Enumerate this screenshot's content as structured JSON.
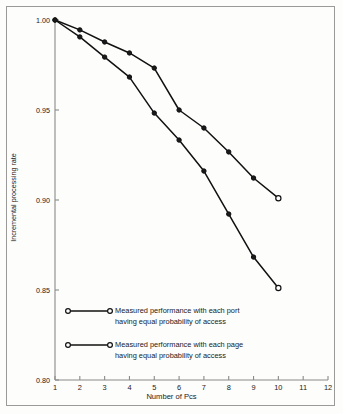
{
  "chart_data": {
    "type": "line",
    "title": "",
    "xlabel": "Number of Pcs",
    "ylabel": "Incremental processing rate",
    "xlim": [
      1,
      12
    ],
    "ylim": [
      0.8,
      1.0
    ],
    "xticks": [
      "1",
      "2",
      "3",
      "4",
      "5",
      "6",
      "7",
      "8",
      "9",
      "10",
      "11",
      "12"
    ],
    "yticks": [
      "1.00",
      "0.95",
      "0.90",
      "0.85",
      "0.80"
    ],
    "grid": false,
    "legend_position": "inside-lower-left",
    "x": [
      1,
      2,
      3,
      4,
      5,
      6,
      7,
      8,
      9,
      10
    ],
    "series": [
      {
        "name": "Measured performance with each port having equal probability of access",
        "label_line1": "Measured performance with each port",
        "label_line2": "having equal probability of access",
        "marker": "circle",
        "color": "#111111",
        "values": [
          1.0,
          0.9945,
          0.9895,
          0.9835,
          0.9795,
          0.9722,
          0.9655,
          0.9595,
          0.9512,
          0.901
        ]
      },
      {
        "name": "Measured performance with each page having equal probability of access",
        "label_line1": "Measured performance with each page",
        "label_line2": "having equal probability of access",
        "marker": "circle",
        "color": "#111111",
        "values": [
          1.0,
          0.992,
          0.9845,
          0.9785,
          0.9705,
          0.9628,
          0.9545,
          0.9445,
          0.934,
          0.851
        ]
      }
    ],
    "series_plotted": [
      {
        "name": "port",
        "points": [
          {
            "x": 1,
            "y": 1.0
          },
          {
            "x": 2,
            "y": 0.9945
          },
          {
            "x": 3,
            "y": 0.9878
          },
          {
            "x": 4,
            "y": 0.9817
          },
          {
            "x": 5,
            "y": 0.9733
          },
          {
            "x": 6,
            "y": 0.95
          },
          {
            "x": 7,
            "y": 0.94
          },
          {
            "x": 8,
            "y": 0.9267
          },
          {
            "x": 9,
            "y": 0.9122
          },
          {
            "x": 10,
            "y": 0.901
          }
        ]
      },
      {
        "name": "page",
        "points": [
          {
            "x": 1,
            "y": 1.0
          },
          {
            "x": 2,
            "y": 0.9906
          },
          {
            "x": 3,
            "y": 0.9794
          },
          {
            "x": 4,
            "y": 0.9683
          },
          {
            "x": 5,
            "y": 0.9483
          },
          {
            "x": 6,
            "y": 0.9333
          },
          {
            "x": 7,
            "y": 0.9161
          },
          {
            "x": 8,
            "y": 0.8922
          },
          {
            "x": 9,
            "y": 0.8683
          },
          {
            "x": 10,
            "y": 0.8511
          }
        ]
      }
    ],
    "colors": {
      "line": "#111111",
      "axis": "#8a8a88",
      "text": "#1a1a1a",
      "background": "#fdfdfc",
      "frame": "#9a9a98"
    }
  }
}
